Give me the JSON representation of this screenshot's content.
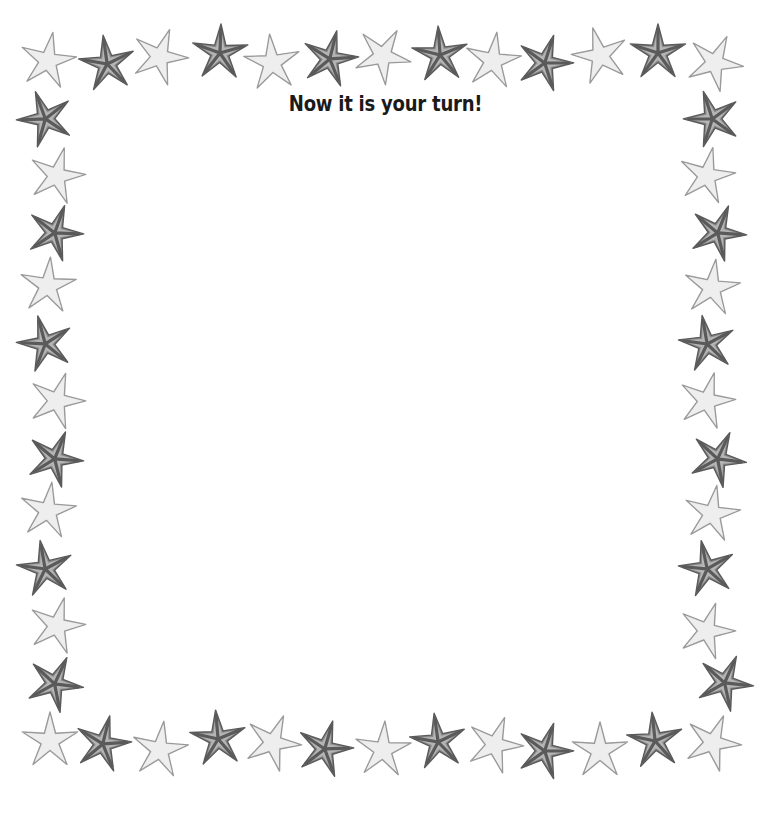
{
  "title": "Now it is your turn!",
  "colors": {
    "background": "#ffffff",
    "title_text": "#1a1a1a",
    "dark_star_fill": "#8a8a8a",
    "dark_star_stroke": "#5a5a5a",
    "dark_star_highlight": "#d8d8d8",
    "light_star_fill": "#e6e6e6",
    "light_star_stroke": "#9a9a9a"
  },
  "border": {
    "icon": "starfish-icon",
    "pattern": "alternating light and dark starfish",
    "top_row": [
      {
        "x": 48,
        "y": 60,
        "tone": "light",
        "rot": 10
      },
      {
        "x": 107,
        "y": 63,
        "tone": "dark",
        "rot": -8
      },
      {
        "x": 160,
        "y": 56,
        "tone": "light",
        "rot": 20
      },
      {
        "x": 220,
        "y": 52,
        "tone": "dark",
        "rot": 2
      },
      {
        "x": 272,
        "y": 62,
        "tone": "light",
        "rot": -5
      },
      {
        "x": 330,
        "y": 58,
        "tone": "dark",
        "rot": 14
      },
      {
        "x": 383,
        "y": 55,
        "tone": "light",
        "rot": 30
      },
      {
        "x": 440,
        "y": 54,
        "tone": "dark",
        "rot": -4
      },
      {
        "x": 493,
        "y": 60,
        "tone": "light",
        "rot": 8
      },
      {
        "x": 545,
        "y": 62,
        "tone": "dark",
        "rot": 18
      },
      {
        "x": 600,
        "y": 55,
        "tone": "light",
        "rot": -15
      },
      {
        "x": 658,
        "y": 52,
        "tone": "dark",
        "rot": 0
      },
      {
        "x": 715,
        "y": 62,
        "tone": "light",
        "rot": 25
      }
    ],
    "left_column": [
      {
        "x": 45,
        "y": 118,
        "tone": "dark",
        "rot": -20
      },
      {
        "x": 57,
        "y": 175,
        "tone": "light",
        "rot": 15
      },
      {
        "x": 55,
        "y": 232,
        "tone": "dark",
        "rot": 20
      },
      {
        "x": 48,
        "y": 285,
        "tone": "light",
        "rot": 5
      },
      {
        "x": 45,
        "y": 343,
        "tone": "dark",
        "rot": -15
      },
      {
        "x": 57,
        "y": 400,
        "tone": "light",
        "rot": 18
      },
      {
        "x": 55,
        "y": 458,
        "tone": "dark",
        "rot": 22
      },
      {
        "x": 48,
        "y": 510,
        "tone": "light",
        "rot": 8
      },
      {
        "x": 45,
        "y": 568,
        "tone": "dark",
        "rot": -10
      },
      {
        "x": 57,
        "y": 625,
        "tone": "light",
        "rot": 15
      },
      {
        "x": 55,
        "y": 683,
        "tone": "dark",
        "rot": 25
      }
    ],
    "right_column": [
      {
        "x": 712,
        "y": 118,
        "tone": "dark",
        "rot": -18
      },
      {
        "x": 707,
        "y": 175,
        "tone": "light",
        "rot": 12
      },
      {
        "x": 718,
        "y": 232,
        "tone": "dark",
        "rot": 22
      },
      {
        "x": 712,
        "y": 287,
        "tone": "light",
        "rot": 8
      },
      {
        "x": 707,
        "y": 343,
        "tone": "dark",
        "rot": -10
      },
      {
        "x": 707,
        "y": 400,
        "tone": "light",
        "rot": 15
      },
      {
        "x": 718,
        "y": 458,
        "tone": "dark",
        "rot": 25
      },
      {
        "x": 712,
        "y": 513,
        "tone": "light",
        "rot": 10
      },
      {
        "x": 707,
        "y": 568,
        "tone": "dark",
        "rot": -12
      },
      {
        "x": 707,
        "y": 630,
        "tone": "light",
        "rot": 18
      },
      {
        "x": 725,
        "y": 682,
        "tone": "dark",
        "rot": 24
      }
    ],
    "bottom_row": [
      {
        "x": 50,
        "y": 740,
        "tone": "light",
        "rot": 0
      },
      {
        "x": 103,
        "y": 743,
        "tone": "dark",
        "rot": 14
      },
      {
        "x": 160,
        "y": 749,
        "tone": "light",
        "rot": 8
      },
      {
        "x": 218,
        "y": 738,
        "tone": "dark",
        "rot": -5
      },
      {
        "x": 273,
        "y": 742,
        "tone": "light",
        "rot": 22
      },
      {
        "x": 325,
        "y": 748,
        "tone": "dark",
        "rot": 16
      },
      {
        "x": 383,
        "y": 749,
        "tone": "light",
        "rot": 4
      },
      {
        "x": 438,
        "y": 741,
        "tone": "dark",
        "rot": -8
      },
      {
        "x": 495,
        "y": 744,
        "tone": "light",
        "rot": 20
      },
      {
        "x": 545,
        "y": 750,
        "tone": "dark",
        "rot": 18
      },
      {
        "x": 600,
        "y": 750,
        "tone": "light",
        "rot": 0
      },
      {
        "x": 655,
        "y": 740,
        "tone": "dark",
        "rot": -6
      },
      {
        "x": 713,
        "y": 742,
        "tone": "light",
        "rot": 22
      }
    ]
  }
}
